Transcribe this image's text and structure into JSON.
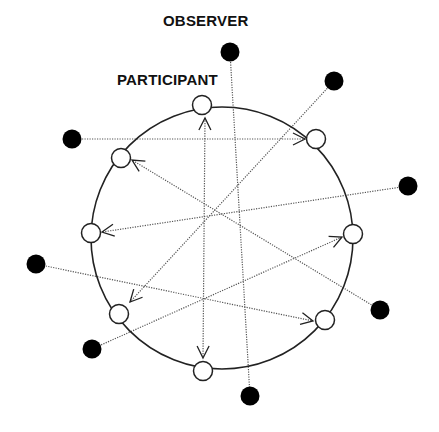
{
  "labels": {
    "observer": "OBSERVER",
    "participant": "PARTICIPANT"
  },
  "colors": {
    "stroke": "#222222",
    "dotted_line": "#555555",
    "observer_fill": "#000000",
    "participant_fill": "#ffffff",
    "background": "#ffffff"
  },
  "circle": {
    "cx": 222,
    "cy": 238,
    "r": 131
  },
  "participants": [
    {
      "id": "p-top",
      "x": 202,
      "y": 105
    },
    {
      "id": "p-top-right",
      "x": 316,
      "y": 139
    },
    {
      "id": "p-right",
      "x": 353,
      "y": 234
    },
    {
      "id": "p-bottom-right",
      "x": 325,
      "y": 320
    },
    {
      "id": "p-bottom",
      "x": 203,
      "y": 371
    },
    {
      "id": "p-bottom-left",
      "x": 119,
      "y": 314
    },
    {
      "id": "p-left",
      "x": 91,
      "y": 233
    },
    {
      "id": "p-top-left",
      "x": 121,
      "y": 158
    }
  ],
  "observers": [
    {
      "id": "o-top",
      "x": 230,
      "y": 52
    },
    {
      "id": "o-top-right",
      "x": 334,
      "y": 81
    },
    {
      "id": "o-right",
      "x": 408,
      "y": 186
    },
    {
      "id": "o-lower-right",
      "x": 380,
      "y": 310
    },
    {
      "id": "o-bottom",
      "x": 250,
      "y": 396
    },
    {
      "id": "o-bottom-left",
      "x": 92,
      "y": 349
    },
    {
      "id": "o-left-low",
      "x": 36,
      "y": 264
    },
    {
      "id": "o-left-high",
      "x": 72,
      "y": 139
    }
  ],
  "connections": [
    {
      "from": [
        72,
        139
      ],
      "to": [
        305,
        139
      ],
      "arrow_end": true,
      "arrow_start": false
    },
    {
      "from": [
        230,
        52
      ],
      "to": [
        250,
        396
      ],
      "arrow_end": false,
      "arrow_start": false
    },
    {
      "from": [
        205,
        118
      ],
      "to": [
        203,
        358
      ],
      "arrow_end": true,
      "arrow_start": true
    },
    {
      "from": [
        334,
        81
      ],
      "to": [
        130,
        302
      ],
      "arrow_end": true,
      "arrow_start": false
    },
    {
      "from": [
        408,
        186
      ],
      "to": [
        102,
        232
      ],
      "arrow_end": true,
      "arrow_start": false
    },
    {
      "from": [
        380,
        310
      ],
      "to": [
        132,
        160
      ],
      "arrow_end": true,
      "arrow_start": false
    },
    {
      "from": [
        36,
        264
      ],
      "to": [
        313,
        321
      ],
      "arrow_end": true,
      "arrow_start": false
    },
    {
      "from": [
        92,
        349
      ],
      "to": [
        342,
        237
      ],
      "arrow_end": true,
      "arrow_start": false
    }
  ]
}
